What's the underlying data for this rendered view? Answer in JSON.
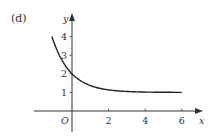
{
  "panel_label": "(d)",
  "chart_data": {
    "type": "line",
    "title": "",
    "xlabel": "x",
    "ylabel": "y",
    "origin_label": "O",
    "xlim": [
      -1.1,
      6
    ],
    "ylim": [
      0,
      4.3
    ],
    "x_ticks": [
      "2",
      "4",
      "6"
    ],
    "y_ticks": [
      "1",
      "2",
      "3",
      "4"
    ],
    "series": [
      {
        "name": "curve",
        "function": "y = 1 + e^(-x)",
        "x": [
          -1.1,
          -1,
          -0.5,
          0,
          0.5,
          1,
          1.5,
          2,
          3,
          4,
          5,
          6
        ],
        "y": [
          4.0,
          3.72,
          2.65,
          2.0,
          1.61,
          1.37,
          1.22,
          1.14,
          1.05,
          1.02,
          1.01,
          1.0
        ]
      }
    ],
    "grid": false,
    "legend": false
  }
}
